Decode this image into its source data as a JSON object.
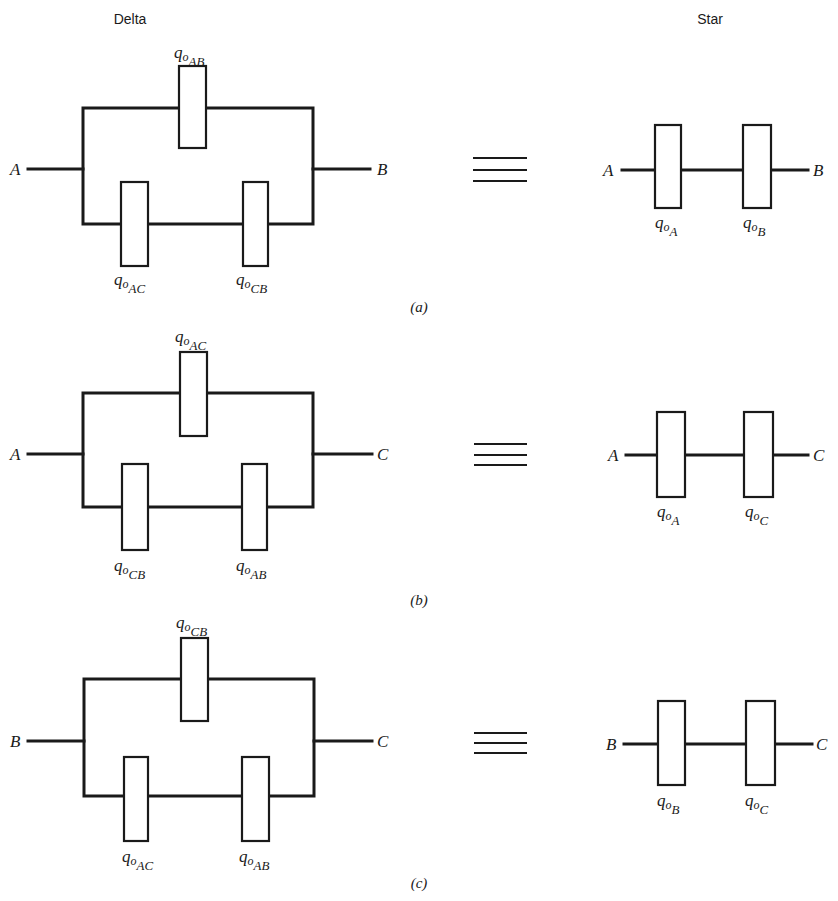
{
  "figure": {
    "column_headers": {
      "delta": "Delta",
      "star": "Star"
    },
    "panels": [
      {
        "id": "a",
        "caption": "(a)",
        "delta": {
          "left_terminal": "A",
          "right_terminal": "B",
          "top_element": {
            "q": "q",
            "o": "o",
            "sub": "AB"
          },
          "bottom_left_element": {
            "q": "q",
            "o": "o",
            "sub": "AC"
          },
          "bottom_right_element": {
            "q": "q",
            "o": "o",
            "sub": "CB"
          }
        },
        "equivalence_symbol": "≡",
        "star": {
          "left_terminal": "A",
          "right_terminal": "B",
          "left_element": {
            "q": "q",
            "o": "o",
            "sub": "A"
          },
          "right_element": {
            "q": "q",
            "o": "o",
            "sub": "B"
          }
        }
      },
      {
        "id": "b",
        "caption": "(b)",
        "delta": {
          "left_terminal": "A",
          "right_terminal": "C",
          "top_element": {
            "q": "q",
            "o": "o",
            "sub": "AC"
          },
          "bottom_left_element": {
            "q": "q",
            "o": "o",
            "sub": "CB"
          },
          "bottom_right_element": {
            "q": "q",
            "o": "o",
            "sub": "AB"
          }
        },
        "equivalence_symbol": "≡",
        "star": {
          "left_terminal": "A",
          "right_terminal": "C",
          "left_element": {
            "q": "q",
            "o": "o",
            "sub": "A"
          },
          "right_element": {
            "q": "q",
            "o": "o",
            "sub": "C"
          }
        }
      },
      {
        "id": "c",
        "caption": "(c)",
        "delta": {
          "left_terminal": "B",
          "right_terminal": "C",
          "top_element": {
            "q": "q",
            "o": "o",
            "sub": "CB"
          },
          "bottom_left_element": {
            "q": "q",
            "o": "o",
            "sub": "AC"
          },
          "bottom_right_element": {
            "q": "q",
            "o": "o",
            "sub": "AB"
          }
        },
        "equivalence_symbol": "≡",
        "star": {
          "left_terminal": "B",
          "right_terminal": "C",
          "left_element": {
            "q": "q",
            "o": "o",
            "sub": "B"
          },
          "right_element": {
            "q": "q",
            "o": "o",
            "sub": "C"
          }
        }
      }
    ]
  }
}
